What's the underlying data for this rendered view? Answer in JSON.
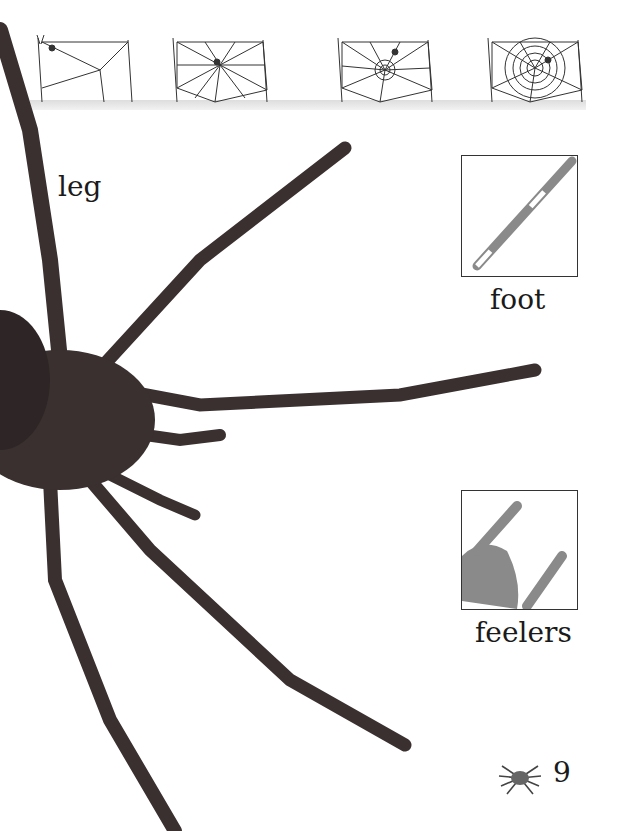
{
  "page": {
    "number": "9",
    "web_stages": [
      "stage-1",
      "stage-2",
      "stage-3",
      "stage-4"
    ],
    "labels": {
      "leg": "leg",
      "foot": "foot",
      "feelers": "feelers"
    }
  },
  "colors": {
    "spider_body": "#3a3030",
    "ink": "#1a1a1a",
    "inset_shade": "#8a8a8a"
  }
}
